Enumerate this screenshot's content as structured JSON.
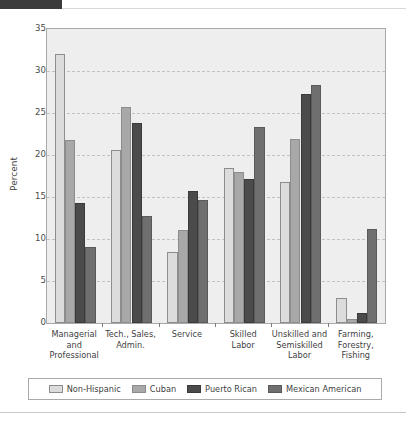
{
  "header": {
    "tab_label": "",
    "caption": ""
  },
  "chart_data": {
    "type": "bar",
    "title": "",
    "xlabel": "",
    "ylabel": "Percent",
    "ylim": [
      0,
      35
    ],
    "ytick_step": 5,
    "yticks": [
      "0",
      "5",
      "10",
      "15",
      "20",
      "25",
      "30",
      "35"
    ],
    "grid": true,
    "legend_position": "bottom",
    "categories": [
      "Managerial and Professional",
      "Tech., Sales, Admin.",
      "Service",
      "Skilled Labor",
      "Unskilled and Semiskilled Labor",
      "Farming, Forestry, Fishing"
    ],
    "category_lines": [
      [
        "Managerial",
        "and",
        "Professional"
      ],
      [
        "Tech., Sales,",
        "Admin."
      ],
      [
        "Service"
      ],
      [
        "Skilled",
        "Labor"
      ],
      [
        "Unskilled and",
        "Semiskilled",
        "Labor"
      ],
      [
        "Farming,",
        "Forestry,",
        "Fishing"
      ]
    ],
    "series": [
      {
        "name": "Non-Hispanic",
        "color": "#dcdcdc",
        "values": [
          32.0,
          20.6,
          8.5,
          18.4,
          16.8,
          3.0
        ]
      },
      {
        "name": "Cuban",
        "color": "#a8a8a8",
        "values": [
          21.8,
          25.7,
          11.1,
          18.0,
          21.9,
          0.5
        ]
      },
      {
        "name": "Puerto Rican",
        "color": "#4b4b4b",
        "values": [
          14.3,
          23.8,
          15.7,
          17.1,
          27.3,
          1.2
        ]
      },
      {
        "name": "Mexican American",
        "color": "#6f6f6f",
        "values": [
          9.1,
          12.7,
          14.6,
          23.3,
          28.3,
          11.2
        ]
      }
    ]
  }
}
